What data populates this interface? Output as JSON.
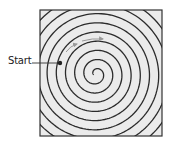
{
  "diagram": {
    "type": "spiral-path",
    "start_label": "Start",
    "box": {
      "x": 40,
      "y": 10,
      "width": 122,
      "height": 126
    },
    "colors": {
      "box_fill": "#ebebeb",
      "box_stroke": "#333333",
      "spiral_stroke": "#2b2b2b",
      "arrow_color": "#9a9a9a",
      "start_dot": "#222222"
    },
    "icons": {
      "start_marker": "filled-dot",
      "direction_arrows": [
        "arrow-right",
        "arrow-right"
      ]
    }
  }
}
